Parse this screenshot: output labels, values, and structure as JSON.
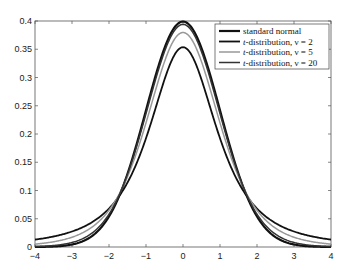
{
  "chart_data": {
    "type": "line",
    "title": "",
    "xlabel": "",
    "ylabel": "",
    "xlim": [
      -4,
      4
    ],
    "ylim": [
      0,
      0.4
    ],
    "xticks": [
      -4,
      -3,
      -2,
      -1,
      0,
      1,
      2,
      3,
      4
    ],
    "xtick_labels": [
      "−4",
      "−3",
      "−2",
      "−1",
      "0",
      "1",
      "2",
      "3",
      "4"
    ],
    "yticks": [
      0,
      0.05,
      0.1,
      0.15,
      0.2,
      0.25,
      0.3,
      0.35,
      0.4
    ],
    "ytick_labels": [
      "0",
      "0.05",
      "0.1",
      "0.15",
      "0.2",
      "0.25",
      "0.3",
      "0.35",
      "0.4"
    ],
    "grid": false,
    "legend_position": "upper right",
    "series": [
      {
        "name": "standard normal",
        "color": "#111111",
        "width": 2.2,
        "dist": "normal",
        "peak": 0.399,
        "values_at_integer_x": [
          0.0001,
          0.0044,
          0.054,
          0.242,
          0.399,
          0.242,
          0.054,
          0.0044,
          0.0001
        ]
      },
      {
        "name": "t-distribution, ν = 2",
        "color": "#111111",
        "width": 1.8,
        "dist": "t",
        "nu": 2,
        "peak": 0.354,
        "values_at_integer_x": [
          0.013,
          0.027,
          0.068,
          0.192,
          0.354,
          0.192,
          0.068,
          0.027,
          0.013
        ]
      },
      {
        "name": "t-distribution, ν = 5",
        "color": "#999999",
        "width": 1.5,
        "dist": "t",
        "nu": 5,
        "peak": 0.38,
        "values_at_integer_x": [
          0.005,
          0.017,
          0.065,
          0.22,
          0.38,
          0.22,
          0.065,
          0.017,
          0.005
        ]
      },
      {
        "name": "t-distribution, ν = 20",
        "color": "#333333",
        "width": 1.5,
        "dist": "t",
        "nu": 20,
        "peak": 0.394,
        "values_at_integer_x": [
          0.0008,
          0.0074,
          0.058,
          0.236,
          0.394,
          0.236,
          0.058,
          0.0074,
          0.0008
        ]
      }
    ]
  },
  "legend": {
    "items": [
      {
        "prefix": "",
        "label": "standard normal"
      },
      {
        "prefix": "t",
        "label": "-distribution, ν = 2"
      },
      {
        "prefix": "t",
        "label": "-distribution, ν = 5"
      },
      {
        "prefix": "t",
        "label": "-distribution, ν = 20"
      }
    ]
  }
}
